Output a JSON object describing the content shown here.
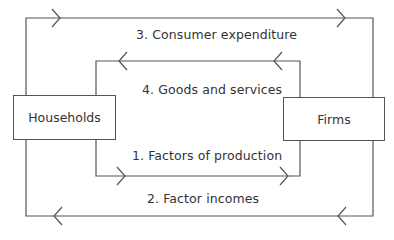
{
  "diagram": {
    "type": "circular-flow",
    "nodes": {
      "households": {
        "label": "Households"
      },
      "firms": {
        "label": "Firms"
      }
    },
    "flows": [
      {
        "label": "1. Factors of production",
        "from": "households",
        "to": "firms"
      },
      {
        "label": "2. Factor incomes",
        "from": "firms",
        "to": "households"
      },
      {
        "label": "3. Consumer expenditure",
        "from": "households",
        "to": "firms"
      },
      {
        "label": "4. Goods and services",
        "from": "firms",
        "to": "households"
      }
    ],
    "line_color": "#555555"
  }
}
